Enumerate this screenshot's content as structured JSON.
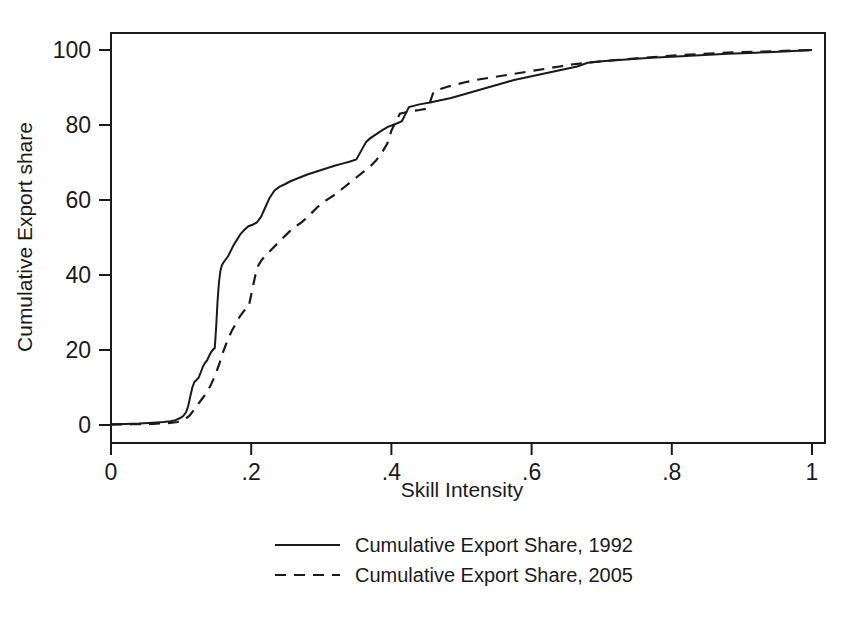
{
  "chart_data": {
    "type": "line",
    "title": "",
    "subtitle": "",
    "xlabel": "Skill Intensity",
    "ylabel": "Cumulative Export share",
    "xlim": [
      0,
      1
    ],
    "ylim": [
      0,
      100
    ],
    "xticks": [
      0,
      0.2,
      0.4,
      0.6,
      0.8,
      1
    ],
    "xticklabels": [
      "0",
      ".2",
      ".4",
      ".6",
      ".8",
      "1"
    ],
    "yticks": [
      0,
      20,
      40,
      60,
      80,
      100
    ],
    "yticklabels": [
      "0",
      "20",
      "40",
      "60",
      "80",
      "100"
    ],
    "grid": false,
    "legend_position": "below",
    "series": [
      {
        "name": "Cumulative Export Share, 1992",
        "style": "solid",
        "color": "#1a1a1a",
        "x": [
          0.0,
          0.02,
          0.04,
          0.06,
          0.075,
          0.085,
          0.092,
          0.098,
          0.103,
          0.107,
          0.11,
          0.113,
          0.116,
          0.119,
          0.122,
          0.125,
          0.128,
          0.131,
          0.134,
          0.137,
          0.14,
          0.143,
          0.146,
          0.148,
          0.15,
          0.152,
          0.154,
          0.156,
          0.158,
          0.16,
          0.163,
          0.167,
          0.171,
          0.175,
          0.18,
          0.185,
          0.19,
          0.196,
          0.202,
          0.208,
          0.214,
          0.22,
          0.226,
          0.233,
          0.24,
          0.248,
          0.256,
          0.264,
          0.272,
          0.28,
          0.29,
          0.3,
          0.31,
          0.32,
          0.33,
          0.34,
          0.35,
          0.358,
          0.364,
          0.37,
          0.378,
          0.386,
          0.395,
          0.405,
          0.415,
          0.425,
          0.44,
          0.455,
          0.47,
          0.485,
          0.5,
          0.515,
          0.53,
          0.545,
          0.56,
          0.575,
          0.59,
          0.605,
          0.62,
          0.635,
          0.65,
          0.665,
          0.68,
          0.7,
          0.72,
          0.745,
          0.77,
          0.8,
          0.84,
          0.88,
          0.92,
          0.96,
          1.0
        ],
        "y": [
          0.2,
          0.3,
          0.4,
          0.6,
          0.8,
          1.0,
          1.3,
          1.8,
          2.4,
          3.4,
          5.0,
          7.5,
          10.0,
          11.5,
          12.0,
          12.6,
          14.0,
          15.5,
          16.5,
          17.2,
          18.4,
          19.5,
          20.2,
          20.5,
          26.0,
          33.0,
          38.0,
          41.0,
          42.5,
          43.2,
          44.0,
          45.0,
          46.5,
          48.0,
          49.5,
          51.0,
          52.0,
          53.0,
          53.4,
          54.0,
          55.5,
          58.0,
          60.5,
          62.5,
          63.5,
          64.2,
          65.0,
          65.6,
          66.2,
          66.8,
          67.4,
          68.0,
          68.6,
          69.2,
          69.7,
          70.2,
          70.8,
          73.5,
          75.5,
          76.5,
          77.5,
          78.5,
          79.5,
          80.2,
          81.0,
          84.8,
          85.5,
          86.0,
          86.6,
          87.2,
          88.0,
          88.8,
          89.6,
          90.4,
          91.2,
          92.0,
          92.6,
          93.2,
          93.8,
          94.4,
          95.0,
          95.6,
          96.6,
          97.0,
          97.3,
          97.6,
          97.9,
          98.2,
          98.6,
          99.0,
          99.3,
          99.6,
          100.0
        ]
      },
      {
        "name": "Cumulative Export Share, 2005",
        "style": "dashed",
        "color": "#1a1a1a",
        "x": [
          0.0,
          0.03,
          0.06,
          0.08,
          0.095,
          0.105,
          0.112,
          0.118,
          0.124,
          0.13,
          0.136,
          0.142,
          0.148,
          0.154,
          0.16,
          0.166,
          0.172,
          0.178,
          0.184,
          0.19,
          0.196,
          0.202,
          0.206,
          0.21,
          0.215,
          0.222,
          0.23,
          0.238,
          0.246,
          0.254,
          0.262,
          0.27,
          0.278,
          0.286,
          0.294,
          0.302,
          0.31,
          0.32,
          0.33,
          0.34,
          0.35,
          0.36,
          0.37,
          0.378,
          0.386,
          0.394,
          0.4,
          0.412,
          0.425,
          0.44,
          0.452,
          0.46,
          0.47,
          0.48,
          0.492,
          0.505,
          0.52,
          0.54,
          0.56,
          0.58,
          0.6,
          0.62,
          0.64,
          0.66,
          0.68,
          0.7,
          0.725,
          0.75,
          0.78,
          0.81,
          0.845,
          0.88,
          0.915,
          0.95,
          0.975,
          1.0
        ],
        "y": [
          0.1,
          0.2,
          0.3,
          0.5,
          0.8,
          1.5,
          2.5,
          4.0,
          5.5,
          7.0,
          8.5,
          10.5,
          13.0,
          16.0,
          19.5,
          22.5,
          25.0,
          27.0,
          29.0,
          30.5,
          31.2,
          36.5,
          40.0,
          42.5,
          44.0,
          45.5,
          47.0,
          48.5,
          50.0,
          51.5,
          52.8,
          53.8,
          55.0,
          56.5,
          58.0,
          59.3,
          60.3,
          61.5,
          63.0,
          64.5,
          66.0,
          67.5,
          69.0,
          70.5,
          72.5,
          75.0,
          78.5,
          83.0,
          83.6,
          84.0,
          84.4,
          88.8,
          89.6,
          90.2,
          90.8,
          91.4,
          92.0,
          92.6,
          93.2,
          93.8,
          94.4,
          95.0,
          95.6,
          96.2,
          96.6,
          97.0,
          97.4,
          97.8,
          98.2,
          98.6,
          99.0,
          99.3,
          99.5,
          99.7,
          99.9,
          100.0
        ]
      }
    ],
    "legend": [
      {
        "label": "Cumulative Export Share, 1992",
        "style": "solid"
      },
      {
        "label": "Cumulative Export Share, 2005",
        "style": "dashed"
      }
    ]
  }
}
